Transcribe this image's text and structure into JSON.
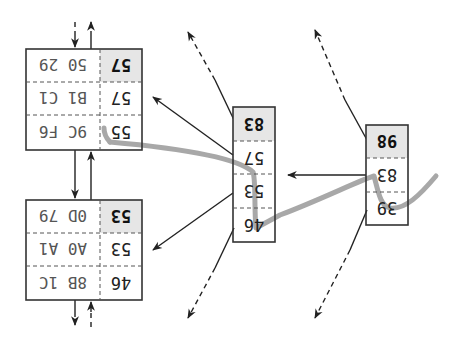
{
  "diagram": {
    "orientation": "rotated-180",
    "colors": {
      "box_border": "#333333",
      "shaded_cell": "#e6e6e6",
      "highlight_path": "#a8a8a8",
      "edge": "#222222"
    },
    "root": {
      "keys": [
        "98",
        "83",
        "39"
      ],
      "shaded_key": "98"
    },
    "internal": {
      "keys": [
        "83",
        "57",
        "53",
        "46"
      ],
      "shaded_key": "83"
    },
    "leaf_top": {
      "rows": [
        {
          "key": "57",
          "value": "50 29",
          "shaded": true
        },
        {
          "key": "57",
          "value": "B1 C1",
          "shaded": false
        },
        {
          "key": "55",
          "value": "9C F6",
          "shaded": false
        }
      ]
    },
    "leaf_bottom": {
      "rows": [
        {
          "key": "53",
          "value": "0D 79",
          "shaded": true
        },
        {
          "key": "53",
          "value": "A0 A1",
          "shaded": false
        },
        {
          "key": "46",
          "value": "8B 1C",
          "shaded": false
        }
      ]
    }
  }
}
